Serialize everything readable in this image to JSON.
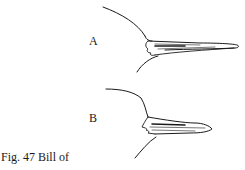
{
  "figure": {
    "labels": {
      "a": "A",
      "b": "B"
    },
    "caption": "Fig. 47 Bill of",
    "caption_cutoff": "… … …"
  }
}
